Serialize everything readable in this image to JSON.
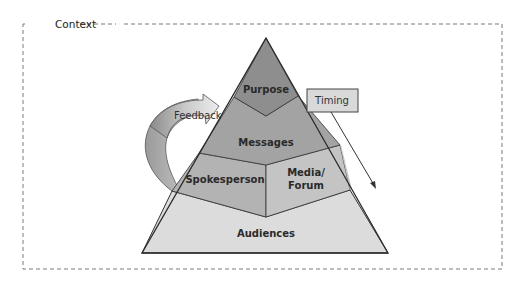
{
  "diagram": {
    "context": {
      "label": "Context"
    },
    "pyramid": {
      "layers": [
        {
          "id": "purpose",
          "label": "Purpose",
          "color": "#8e8e8e"
        },
        {
          "id": "messages",
          "label": "Messages",
          "color": "#a3a3a3"
        },
        {
          "id": "spokesperson",
          "label": "Spokesperson",
          "color": "#b3b3b3"
        },
        {
          "id": "media-forum",
          "label_line1": "Media/",
          "label_line2": "Forum",
          "color": "#c4c4c4"
        },
        {
          "id": "audiences",
          "label": "Audiences",
          "color": "#dcdcdc"
        }
      ]
    },
    "feedback": {
      "label": "Feedback"
    },
    "timing": {
      "label": "Timing",
      "color": "#d9d9d9"
    }
  }
}
